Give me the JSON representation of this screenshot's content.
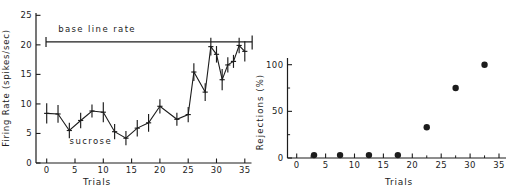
{
  "figure": {
    "background": "#ffffff",
    "ink": "#1c1c1c"
  },
  "chart_data": [
    {
      "id": "firing_rate",
      "type": "line",
      "title": "",
      "xlabel": "Trials",
      "ylabel": "Firing Rate (spikes/sec)",
      "xlim": [
        0,
        36.5
      ],
      "ylim": [
        0,
        25.5
      ],
      "xticks": [
        0,
        5,
        10,
        15,
        20,
        25,
        30,
        35
      ],
      "yticks": [
        0,
        5,
        10,
        15,
        20,
        25
      ],
      "grid": false,
      "legend": "none",
      "baseline": {
        "label": "base line rate",
        "value": 20.5,
        "x_start": -0.12,
        "x_end": 36.3,
        "label_xy": [
          8.9,
          22.2
        ]
      },
      "series": [
        {
          "name": "sucrose",
          "label": "sucrose",
          "label_xy": [
            7.8,
            3.3
          ],
          "x": [
            0,
            2,
            4,
            6,
            8,
            10,
            12,
            14,
            16,
            18,
            20,
            23,
            25,
            26,
            28,
            29,
            30,
            31,
            32,
            33,
            34,
            35
          ],
          "y": [
            8.4,
            8.3,
            5.5,
            7.2,
            8.8,
            8.6,
            5.3,
            4.2,
            5.9,
            6.8,
            9.6,
            7.4,
            8.2,
            15.4,
            12.0,
            19.7,
            18.4,
            14.1,
            16.6,
            17.2,
            19.9,
            18.9
          ],
          "yerr": [
            1.7,
            1.5,
            1.3,
            1.3,
            1.1,
            1.7,
            1.3,
            1.2,
            1.4,
            1.5,
            1.2,
            1.1,
            1.3,
            1.5,
            1.5,
            1.5,
            1.4,
            1.8,
            1.3,
            1.1,
            1.3,
            1.7
          ]
        }
      ]
    },
    {
      "id": "rejections",
      "type": "scatter",
      "title": "",
      "xlabel": "Trials",
      "ylabel": "Rejections (%)",
      "xlim": [
        0,
        36
      ],
      "ylim": [
        0,
        107
      ],
      "xticks": [
        0,
        5,
        10,
        15,
        20,
        25,
        30,
        35
      ],
      "xticks_minor_step": 2.5,
      "yticks": [
        0,
        50,
        100
      ],
      "yticks_minor": [
        25,
        75
      ],
      "grid": false,
      "legend": "none",
      "points": {
        "x": [
          3,
          7.5,
          12.5,
          17.5,
          22.5,
          27.5,
          32.5
        ],
        "y": [
          0,
          0,
          0,
          0,
          33,
          75,
          100
        ]
      }
    }
  ]
}
